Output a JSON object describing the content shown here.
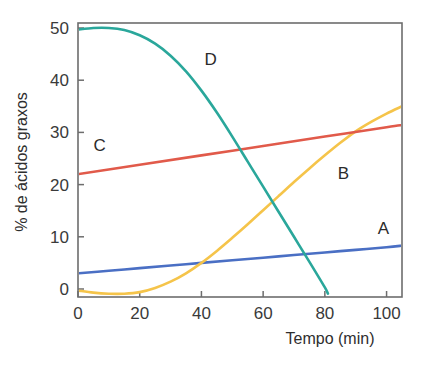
{
  "chart_data": {
    "type": "line",
    "title": "",
    "xlabel": "Tempo (min)",
    "ylabel": "% de ácidos graxos",
    "xlim": [
      0,
      105
    ],
    "ylim": [
      -2,
      51
    ],
    "xticks": [
      0,
      20,
      40,
      60,
      80,
      100
    ],
    "xtick_labels": [
      "0",
      "20",
      "40",
      "60",
      "80",
      "100"
    ],
    "yticks": [
      0,
      10,
      20,
      30,
      40,
      50
    ],
    "ytick_labels": [
      "0",
      "10",
      "20",
      "30",
      "40",
      "50"
    ],
    "grid": false,
    "legend": "inline-labels",
    "series": [
      {
        "name": "A",
        "color": "#4a6fc4",
        "label_x": 99,
        "label_y": 10.5,
        "x": [
          0,
          10,
          20,
          30,
          40,
          50,
          60,
          70,
          80,
          90,
          100,
          105
        ],
        "values": [
          3.0,
          3.5,
          4.0,
          4.5,
          5.0,
          5.5,
          6.0,
          6.5,
          7.0,
          7.5,
          8.0,
          8.3
        ]
      },
      {
        "name": "B",
        "color": "#f5c44a",
        "label_x": 86,
        "label_y": 21.0,
        "x": [
          0,
          5,
          10,
          15,
          20,
          25,
          30,
          35,
          40,
          45,
          50,
          55,
          60,
          65,
          70,
          75,
          80,
          85,
          90,
          95,
          100,
          105
        ],
        "values": [
          -0.3,
          -0.7,
          -0.9,
          -0.9,
          -0.6,
          0.2,
          1.4,
          3.0,
          5.0,
          7.3,
          9.8,
          12.4,
          15.1,
          17.8,
          20.5,
          23.1,
          25.6,
          28.0,
          30.2,
          32.0,
          33.6,
          35.0
        ]
      },
      {
        "name": "C",
        "color": "#e15a4a",
        "label_x": 7,
        "label_y": 26.5,
        "x": [
          0,
          20,
          40,
          60,
          80,
          100,
          105
        ],
        "values": [
          22.0,
          23.8,
          25.6,
          27.4,
          29.2,
          31.0,
          31.4
        ]
      },
      {
        "name": "D",
        "color": "#2aa79b",
        "label_x": 43,
        "label_y": 43.0,
        "x": [
          0,
          5,
          10,
          15,
          20,
          25,
          30,
          35,
          40,
          45,
          50,
          55,
          60,
          65,
          70,
          75,
          80,
          81
        ],
        "values": [
          49.7,
          50.0,
          50.0,
          49.6,
          48.6,
          47.0,
          44.7,
          41.7,
          38.0,
          33.8,
          29.2,
          24.4,
          19.6,
          14.8,
          10.0,
          5.2,
          0.3,
          -0.9
        ]
      }
    ]
  }
}
